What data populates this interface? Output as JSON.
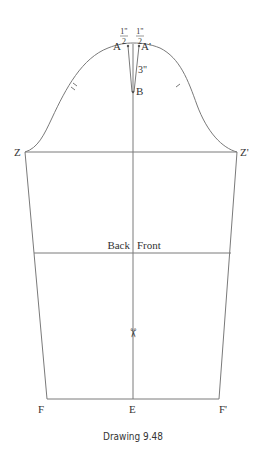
{
  "diagram": {
    "caption": "Drawing 9.48",
    "line_color": "#7a7a7a",
    "text_color": "#333333",
    "points": {
      "A": "A",
      "A_prime": "A'",
      "B": "B",
      "Z": "Z",
      "Z_prime": "Z'",
      "E": "E",
      "F": "F",
      "F_prime": "F'"
    },
    "measurements": {
      "half_inch_left_num": "1\"",
      "half_inch_left_den": "2",
      "half_inch_right_num": "1\"",
      "half_inch_right_den": "2",
      "cap_depth": "3\""
    },
    "section_labels": {
      "back": "Back",
      "front": "Front"
    },
    "icons": {
      "scissors": "✂"
    }
  }
}
